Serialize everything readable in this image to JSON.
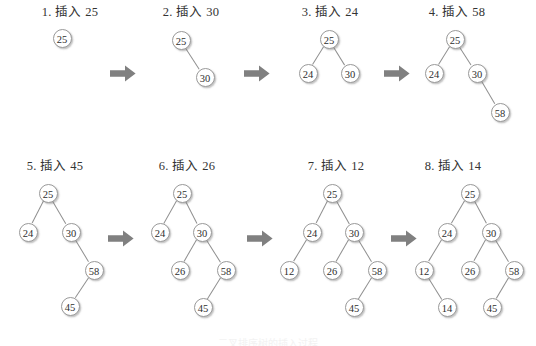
{
  "figure": {
    "colors": {
      "background": "#ffffff",
      "node_fill": "#ffffff",
      "node_stroke": "#9a9a9a",
      "edge": "#8f8f8f",
      "arrow": "#808080",
      "text": "#333333"
    },
    "footnote": "二叉排序树的插入过程"
  },
  "panels": [
    {
      "index": "1",
      "title": "1. 插入 25",
      "inserted_value": "25",
      "nodes": [
        {
          "label": "25",
          "x": 62,
          "y": 38
        }
      ],
      "edges": []
    },
    {
      "index": "2",
      "title": "2. 插入 30",
      "inserted_value": "30",
      "nodes": [
        {
          "label": "25",
          "x": 181,
          "y": 40
        },
        {
          "label": "30",
          "x": 205,
          "y": 77
        }
      ],
      "edges": [
        {
          "from": 0,
          "to": 1
        }
      ]
    },
    {
      "index": "3",
      "title": "3. 插入 24",
      "inserted_value": "24",
      "nodes": [
        {
          "label": "25",
          "x": 329,
          "y": 39
        },
        {
          "label": "24",
          "x": 308,
          "y": 73
        },
        {
          "label": "30",
          "x": 350,
          "y": 73
        }
      ],
      "edges": [
        {
          "from": 0,
          "to": 1
        },
        {
          "from": 0,
          "to": 2
        }
      ]
    },
    {
      "index": "4",
      "title": "4. 插入 58",
      "inserted_value": "58",
      "nodes": [
        {
          "label": "25",
          "x": 455,
          "y": 39
        },
        {
          "label": "24",
          "x": 434,
          "y": 73
        },
        {
          "label": "30",
          "x": 477,
          "y": 73
        },
        {
          "label": "58",
          "x": 500,
          "y": 112
        }
      ],
      "edges": [
        {
          "from": 0,
          "to": 1
        },
        {
          "from": 0,
          "to": 2
        },
        {
          "from": 2,
          "to": 3
        }
      ]
    },
    {
      "index": "5",
      "title": "5. 插入 45",
      "inserted_value": "45",
      "nodes": [
        {
          "label": "25",
          "x": 48,
          "y": 43
        },
        {
          "label": "24",
          "x": 28,
          "y": 82
        },
        {
          "label": "30",
          "x": 71,
          "y": 82
        },
        {
          "label": "58",
          "x": 94,
          "y": 120
        },
        {
          "label": "45",
          "x": 70,
          "y": 156
        }
      ],
      "edges": [
        {
          "from": 0,
          "to": 1
        },
        {
          "from": 0,
          "to": 2
        },
        {
          "from": 2,
          "to": 3
        },
        {
          "from": 3,
          "to": 4
        }
      ]
    },
    {
      "index": "6",
      "title": "6. 插入 26",
      "inserted_value": "26",
      "nodes": [
        {
          "label": "25",
          "x": 182,
          "y": 43
        },
        {
          "label": "24",
          "x": 160,
          "y": 82
        },
        {
          "label": "30",
          "x": 202,
          "y": 82
        },
        {
          "label": "26",
          "x": 180,
          "y": 120
        },
        {
          "label": "58",
          "x": 226,
          "y": 120
        },
        {
          "label": "45",
          "x": 203,
          "y": 157
        }
      ],
      "edges": [
        {
          "from": 0,
          "to": 1
        },
        {
          "from": 0,
          "to": 2
        },
        {
          "from": 2,
          "to": 3
        },
        {
          "from": 2,
          "to": 4
        },
        {
          "from": 4,
          "to": 5
        }
      ]
    },
    {
      "index": "7",
      "title": "7. 插入 12",
      "inserted_value": "12",
      "nodes": [
        {
          "label": "25",
          "x": 332,
          "y": 43
        },
        {
          "label": "24",
          "x": 312,
          "y": 82
        },
        {
          "label": "30",
          "x": 354,
          "y": 82
        },
        {
          "label": "12",
          "x": 289,
          "y": 120
        },
        {
          "label": "26",
          "x": 332,
          "y": 120
        },
        {
          "label": "58",
          "x": 377,
          "y": 120
        },
        {
          "label": "45",
          "x": 354,
          "y": 157
        }
      ],
      "edges": [
        {
          "from": 0,
          "to": 1
        },
        {
          "from": 0,
          "to": 2
        },
        {
          "from": 1,
          "to": 3
        },
        {
          "from": 2,
          "to": 4
        },
        {
          "from": 2,
          "to": 5
        },
        {
          "from": 5,
          "to": 6
        }
      ]
    },
    {
      "index": "8",
      "title": "8. 插入 14",
      "inserted_value": "14",
      "nodes": [
        {
          "label": "25",
          "x": 470,
          "y": 43
        },
        {
          "label": "24",
          "x": 447,
          "y": 82
        },
        {
          "label": "30",
          "x": 491,
          "y": 82
        },
        {
          "label": "12",
          "x": 424,
          "y": 120
        },
        {
          "label": "26",
          "x": 470,
          "y": 120
        },
        {
          "label": "58",
          "x": 514,
          "y": 120
        },
        {
          "label": "14",
          "x": 447,
          "y": 157
        },
        {
          "label": "45",
          "x": 492,
          "y": 157
        }
      ],
      "edges": [
        {
          "from": 0,
          "to": 1
        },
        {
          "from": 0,
          "to": 2
        },
        {
          "from": 1,
          "to": 3
        },
        {
          "from": 2,
          "to": 4
        },
        {
          "from": 2,
          "to": 5
        },
        {
          "from": 3,
          "to": 6
        },
        {
          "from": 5,
          "to": 7
        }
      ]
    }
  ],
  "arrows": [
    {
      "name": "arrow-1-to-2",
      "row": 1,
      "x": 110,
      "y": 65
    },
    {
      "name": "arrow-2-to-3",
      "row": 1,
      "x": 244,
      "y": 65
    },
    {
      "name": "arrow-3-to-4",
      "row": 1,
      "x": 384,
      "y": 65
    },
    {
      "name": "arrow-5-to-6",
      "row": 2,
      "x": 108,
      "y": 80
    },
    {
      "name": "arrow-6-to-7",
      "row": 2,
      "x": 247,
      "y": 80
    },
    {
      "name": "arrow-7-to-8",
      "row": 2,
      "x": 391,
      "y": 80
    }
  ],
  "panel_titles": [
    {
      "text": "1. 插入 25",
      "x": 5,
      "row": 1
    },
    {
      "text": "2. 插入 30",
      "x": 126,
      "row": 1
    },
    {
      "text": "3. 插入 24",
      "x": 265,
      "row": 1
    },
    {
      "text": "4. 插入 58",
      "x": 392,
      "row": 1
    },
    {
      "text": "5. 插入 45",
      "x": -10,
      "row": 2
    },
    {
      "text": "6. 插入 26",
      "x": 122,
      "row": 2
    },
    {
      "text": "7. 插入 12",
      "x": 271,
      "row": 2
    },
    {
      "text": "8. 插入 14",
      "x": 388,
      "row": 2
    }
  ]
}
